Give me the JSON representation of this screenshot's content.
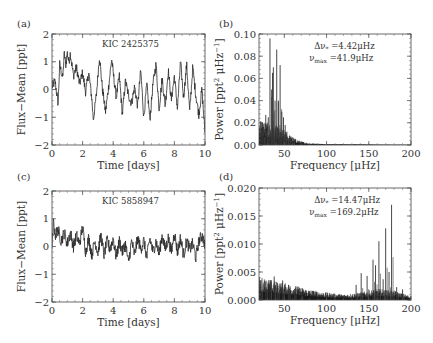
{
  "figure": {
    "panels": [
      {
        "id": "a",
        "label": "(a)"
      },
      {
        "id": "b",
        "label": "(b)"
      },
      {
        "id": "c",
        "label": "(c)"
      },
      {
        "id": "d",
        "label": "(d)"
      }
    ]
  },
  "chart_data": [
    {
      "panel": "(a)",
      "type": "line",
      "title": "KIC 2425375",
      "xlabel": "Time [days]",
      "ylabel": "Flux−Mean [ppt]",
      "xlim": [
        0,
        10
      ],
      "ylim": [
        -2,
        2
      ],
      "xticks": [
        "0",
        "2",
        "4",
        "6",
        "8",
        "10"
      ],
      "yticks": [
        "−2",
        "−1",
        "0",
        "1",
        "2"
      ],
      "grid": false,
      "x": [
        0,
        0.2,
        0.4,
        0.5,
        0.7,
        0.8,
        0.9,
        1.0,
        1.1,
        1.2,
        1.4,
        1.6,
        1.8,
        2.0,
        2.2,
        2.4,
        2.6,
        2.7,
        2.9,
        3.1,
        3.3,
        3.5,
        3.7,
        3.9,
        4.0,
        4.2,
        4.4,
        4.6,
        4.8,
        5.0,
        5.2,
        5.4,
        5.6,
        5.8,
        6.0,
        6.2,
        6.4,
        6.6,
        6.8,
        7.0,
        7.2,
        7.4,
        7.6,
        7.8,
        8.0,
        8.2,
        8.4,
        8.6,
        8.8,
        9.0,
        9.2,
        9.4,
        9.6,
        9.8,
        10.0
      ],
      "values": [
        0.1,
        0.3,
        -0.5,
        0.9,
        0.4,
        1.3,
        0.9,
        1.3,
        1.0,
        1.3,
        0.5,
        0.8,
        0.2,
        0.6,
        -0.1,
        0.6,
        -0.3,
        -1.1,
        -0.2,
        1.2,
        0.0,
        -0.8,
        0.1,
        1.1,
        0.6,
        -0.3,
        0.5,
        -0.9,
        0.3,
        -0.2,
        -0.5,
        0.1,
        -0.6,
        0.7,
        -1.0,
        0.2,
        -1.1,
        0.2,
        0.9,
        -0.7,
        0.4,
        -0.6,
        0.7,
        -0.4,
        0.5,
        -0.7,
        1.0,
        -0.3,
        0.9,
        -0.8,
        0.8,
        -0.2,
        -0.9,
        0.0,
        -1.6
      ]
    },
    {
      "panel": "(b)",
      "type": "bar",
      "title": "",
      "annotations": [
        "Δν* =4.42μHz",
        "νmax =41.9μHz"
      ],
      "annotation_parts": {
        "line1": {
          "sym": "Δν",
          "sub": "*",
          "val": " =4.42μHz"
        },
        "line2": {
          "sym": "ν",
          "sub": "max",
          "val": " =41.9μHz"
        }
      },
      "xlabel": "Frequency [μHz]",
      "ylabel": "Power [ppt² μHz⁻¹]",
      "ylabel_parts": {
        "main": "Power [ppt",
        "sup1": "2",
        "mid": " μHz",
        "sup2": "−1",
        "end": "]"
      },
      "xlim": [
        20,
        200
      ],
      "ylim": [
        0,
        0.1
      ],
      "xticks": [
        "50",
        "100",
        "150",
        "200"
      ],
      "yticks": [
        "0.00",
        "0.02",
        "0.04",
        "0.06",
        "0.08",
        "0.10"
      ],
      "grid": false,
      "peaks": {
        "x": [
          22,
          25,
          28,
          31,
          33,
          35,
          36,
          37,
          39,
          41,
          43,
          45,
          47,
          49,
          51,
          53,
          56,
          60
        ],
        "values": [
          0.021,
          0.016,
          0.027,
          0.025,
          0.096,
          0.05,
          0.065,
          0.07,
          0.04,
          0.086,
          0.04,
          0.072,
          0.03,
          0.025,
          0.018,
          0.012,
          0.008,
          0.007
        ]
      },
      "background_envelope": {
        "x": [
          20,
          30,
          40,
          50,
          60,
          70,
          80,
          100,
          150,
          200
        ],
        "values": [
          0.015,
          0.012,
          0.01,
          0.008,
          0.004,
          0.002,
          0.001,
          0.0005,
          0.0002,
          0.0001
        ]
      }
    },
    {
      "panel": "(c)",
      "type": "line",
      "title": "KIC 5858947",
      "xlabel": "Time [days]",
      "ylabel": "Flux−Mean [ppt]",
      "xlim": [
        0,
        10
      ],
      "ylim": [
        -2,
        2
      ],
      "xticks": [
        "0",
        "2",
        "4",
        "6",
        "8",
        "10"
      ],
      "yticks": [
        "−2",
        "−1",
        "0",
        "1",
        "2"
      ],
      "grid": false,
      "x": [
        0,
        0.1,
        0.2,
        0.4,
        0.6,
        0.8,
        1.0,
        1.2,
        1.4,
        1.6,
        1.8,
        2.0,
        2.2,
        2.4,
        2.6,
        2.8,
        3.0,
        3.2,
        3.4,
        3.6,
        3.8,
        4.0,
        4.2,
        4.4,
        4.6,
        4.8,
        5.0,
        5.2,
        5.4,
        5.6,
        5.8,
        6.0,
        6.2,
        6.4,
        6.6,
        6.8,
        7.0,
        7.2,
        7.4,
        7.6,
        7.8,
        8.0,
        8.2,
        8.4,
        8.6,
        8.8,
        9.0,
        9.2,
        9.4,
        9.6,
        9.8,
        10.0
      ],
      "values": [
        -0.1,
        0.9,
        0.4,
        0.6,
        0.2,
        0.5,
        0.1,
        0.5,
        0.0,
        0.4,
        0.1,
        0.7,
        -0.2,
        0.3,
        -0.3,
        0.2,
        -0.2,
        0.4,
        -0.3,
        0.2,
        -0.1,
        0.3,
        -0.4,
        0.2,
        -0.2,
        0.1,
        -0.6,
        0.2,
        -0.3,
        0.3,
        -0.1,
        0.2,
        -0.4,
        0.3,
        -0.2,
        0.2,
        -0.3,
        0.4,
        -0.1,
        0.3,
        -0.2,
        0.5,
        -0.2,
        0.3,
        -0.3,
        0.2,
        -0.1,
        0.1,
        -0.4,
        0.2,
        0.4,
        0.1
      ]
    },
    {
      "panel": "(d)",
      "type": "bar",
      "title": "",
      "annotations": [
        "Δν* =14.47μHz",
        "νmax =169.2μHz"
      ],
      "annotation_parts": {
        "line1": {
          "sym": "Δν",
          "sub": "*",
          "val": " =14.47μHz"
        },
        "line2": {
          "sym": "ν",
          "sub": "max",
          "val": " =169.2μHz"
        }
      },
      "xlabel": "Frequency [μHz]",
      "ylabel": "Power [ppt² μHz⁻¹]",
      "ylabel_parts": {
        "main": "Power [ppt",
        "sup1": "2",
        "mid": " μHz",
        "sup2": "−1",
        "end": "]"
      },
      "xlim": [
        20,
        200
      ],
      "ylim": [
        0,
        0.02
      ],
      "xticks": [
        "50",
        "100",
        "150",
        "200"
      ],
      "yticks": [
        "0.000",
        "0.005",
        "0.010",
        "0.015",
        "0.020"
      ],
      "grid": false,
      "peaks": {
        "x": [
          22,
          28,
          33,
          38,
          42,
          48,
          55,
          62,
          70,
          135,
          141,
          148,
          155,
          158,
          162,
          167,
          170,
          174,
          177,
          183,
          190
        ],
        "values": [
          0.0035,
          0.0033,
          0.003,
          0.0042,
          0.003,
          0.0035,
          0.0027,
          0.002,
          0.0015,
          0.0027,
          0.0048,
          0.0043,
          0.0072,
          0.0062,
          0.0105,
          0.0037,
          0.0128,
          0.005,
          0.017,
          0.0023,
          0.0019
        ]
      },
      "background_envelope": {
        "x": [
          20,
          40,
          60,
          80,
          100,
          120,
          140,
          160,
          180,
          200
        ],
        "values": [
          0.0025,
          0.002,
          0.0016,
          0.0011,
          0.0008,
          0.0006,
          0.0008,
          0.0012,
          0.001,
          0.0004
        ]
      }
    }
  ]
}
